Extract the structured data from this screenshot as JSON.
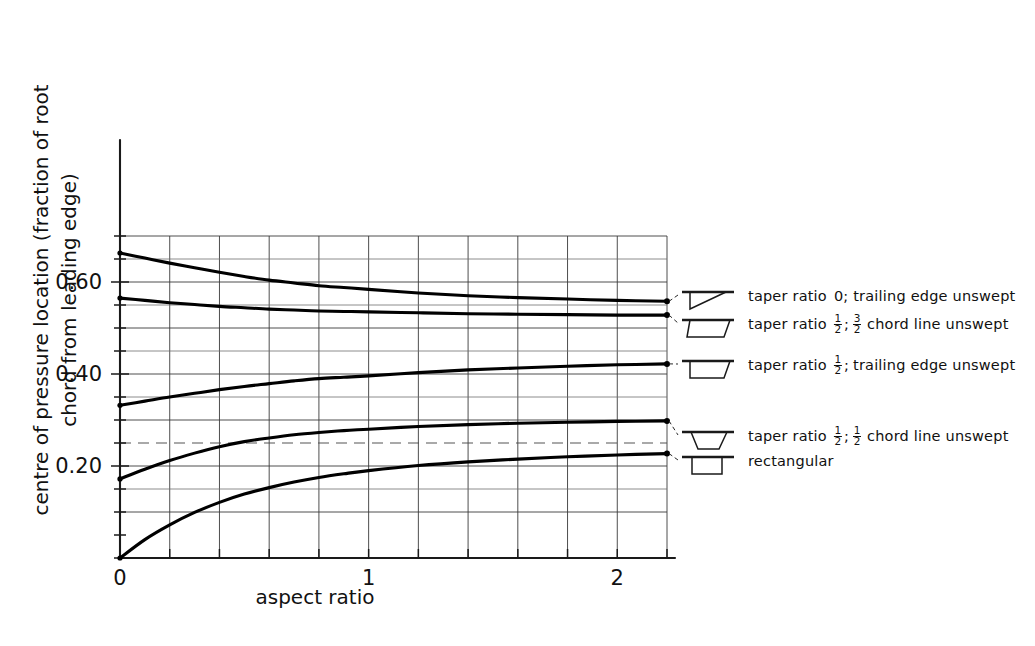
{
  "chart_data": {
    "type": "line",
    "title": "",
    "xlabel": "aspect ratio",
    "ylabel": "centre of pressure location (fraction of root chord from leading edge)",
    "ylabel_line1": "centre of pressure location (fraction of root",
    "ylabel_line2": "chord from leading edge)",
    "xlim": [
      0,
      2.2
    ],
    "ylim": [
      0,
      0.7
    ],
    "grid": true,
    "x_major_ticks": [
      0,
      1,
      2
    ],
    "x_tick_labels": [
      "0",
      "1",
      "2"
    ],
    "x_minor_step": 0.2,
    "y_major_ticks": [
      0.2,
      0.4,
      0.6
    ],
    "y_tick_labels": [
      "0.20",
      "0.40",
      "0.60"
    ],
    "y_minor_step": 0.05,
    "y_gridlines_solid": [
      0.1,
      0.2,
      0.3,
      0.4,
      0.5,
      0.6,
      0.7
    ],
    "y_gridlines_faint": [
      0.15,
      0.35,
      0.45,
      0.55,
      0.65
    ],
    "y_gridline_dashed": 0.25,
    "legend_position": "right",
    "series": [
      {
        "name": "taper ratio 0; trailing edge unswept",
        "planform": "triangle-swept-te-unswept",
        "x": [
          0,
          0.1,
          0.2,
          0.3,
          0.4,
          0.5,
          0.6,
          0.7,
          0.8,
          0.9,
          1.0,
          1.2,
          1.4,
          1.6,
          1.8,
          2.0,
          2.2
        ],
        "values": [
          0.663,
          0.652,
          0.641,
          0.631,
          0.621,
          0.612,
          0.604,
          0.598,
          0.592,
          0.588,
          0.584,
          0.576,
          0.57,
          0.566,
          0.563,
          0.56,
          0.558
        ]
      },
      {
        "name": "taper ratio 1/2; 3/2 chord line unswept",
        "planform": "trapezoid-swept-32chord",
        "x": [
          0,
          0.1,
          0.2,
          0.3,
          0.4,
          0.5,
          0.6,
          0.7,
          0.8,
          0.9,
          1.0,
          1.2,
          1.4,
          1.6,
          1.8,
          2.0,
          2.2
        ],
        "values": [
          0.565,
          0.56,
          0.555,
          0.551,
          0.547,
          0.544,
          0.541,
          0.539,
          0.537,
          0.536,
          0.535,
          0.533,
          0.531,
          0.53,
          0.529,
          0.528,
          0.528
        ]
      },
      {
        "name": "taper ratio 1/2; trailing edge unswept",
        "planform": "trapezoid-te-unswept",
        "x": [
          0,
          0.1,
          0.2,
          0.3,
          0.4,
          0.5,
          0.6,
          0.7,
          0.8,
          0.9,
          1.0,
          1.2,
          1.4,
          1.6,
          1.8,
          2.0,
          2.2
        ],
        "values": [
          0.332,
          0.341,
          0.35,
          0.358,
          0.366,
          0.373,
          0.379,
          0.385,
          0.39,
          0.393,
          0.396,
          0.403,
          0.409,
          0.413,
          0.417,
          0.42,
          0.422
        ]
      },
      {
        "name": "taper ratio 1/2; 1/2 chord line unswept",
        "planform": "trapezoid-symmetric",
        "x": [
          0,
          0.1,
          0.2,
          0.3,
          0.4,
          0.5,
          0.6,
          0.7,
          0.8,
          0.9,
          1.0,
          1.2,
          1.4,
          1.6,
          1.8,
          2.0,
          2.2
        ],
        "values": [
          0.172,
          0.193,
          0.212,
          0.228,
          0.242,
          0.253,
          0.261,
          0.268,
          0.273,
          0.277,
          0.28,
          0.286,
          0.29,
          0.293,
          0.295,
          0.297,
          0.298
        ]
      },
      {
        "name": "rectangular",
        "planform": "rectangle",
        "x": [
          0,
          0.1,
          0.2,
          0.3,
          0.4,
          0.5,
          0.6,
          0.7,
          0.8,
          0.9,
          1.0,
          1.2,
          1.4,
          1.6,
          1.8,
          2.0,
          2.2
        ],
        "values": [
          0.0,
          0.04,
          0.072,
          0.099,
          0.121,
          0.139,
          0.153,
          0.165,
          0.175,
          0.183,
          0.19,
          0.201,
          0.209,
          0.215,
          0.22,
          0.224,
          0.227
        ]
      }
    ]
  },
  "legend": {
    "entries": [
      {
        "label_pre": "taper ratio",
        "label_mid": "0; trailing  edge unswept",
        "fraction1": null,
        "fraction2": null,
        "anchor_y": 0.558,
        "planform": "triangle-swept-te-unswept"
      },
      {
        "label_pre": "taper ratio",
        "label_mid": "chord line unswept",
        "fraction1": {
          "num": "1",
          "den": "2",
          "suffix": ";"
        },
        "fraction2": {
          "num": "3",
          "den": "2",
          "suffix": ""
        },
        "anchor_y": 0.528,
        "planform": "trapezoid-swept-32chord"
      },
      {
        "label_pre": "taper ratio",
        "label_mid": "trailing  edge unswept",
        "fraction1": {
          "num": "1",
          "den": "2",
          "suffix": ";"
        },
        "fraction2": null,
        "anchor_y": 0.422,
        "planform": "trapezoid-te-unswept"
      },
      {
        "label_pre": "taper ratio",
        "label_mid": "chord line  unswept",
        "fraction1": {
          "num": "1",
          "den": "2",
          "suffix": ";"
        },
        "fraction2": {
          "num": "1",
          "den": "2",
          "suffix": ""
        },
        "anchor_y": 0.298,
        "planform": "trapezoid-symmetric"
      },
      {
        "label_pre": "rectangular",
        "label_mid": "",
        "fraction1": null,
        "fraction2": null,
        "anchor_y": 0.227,
        "planform": "rectangle"
      }
    ]
  },
  "colors": {
    "curve": "#000000",
    "grid": "#3a3a3a",
    "axis": "#1a1a1a",
    "background": "#ffffff"
  }
}
